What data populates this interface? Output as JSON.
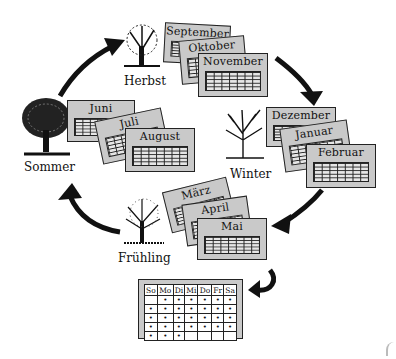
{
  "diagram": {
    "type": "cycle",
    "seasons": [
      {
        "id": "herbst",
        "label": "Herbst",
        "months": [
          "September",
          "Oktober",
          "November"
        ]
      },
      {
        "id": "winter",
        "label": "Winter",
        "months": [
          "Dezember",
          "Januar",
          "Februar"
        ]
      },
      {
        "id": "fruehling",
        "label": "Frühling",
        "months": [
          "März",
          "April",
          "Mai"
        ]
      },
      {
        "id": "sommer",
        "label": "Sommer",
        "months": [
          "Juni",
          "Juli",
          "August"
        ]
      }
    ],
    "cycle_order": [
      "Sommer",
      "Herbst",
      "Winter",
      "Frühling",
      "Sommer"
    ],
    "week_calendar": {
      "days": [
        "So",
        "Mo",
        "Di",
        "Mi",
        "Do",
        "Fr",
        "Sa"
      ],
      "rows": [
        [
          false,
          true,
          true,
          true,
          true,
          true,
          true
        ],
        [
          true,
          true,
          true,
          true,
          true,
          true,
          true
        ],
        [
          true,
          true,
          true,
          true,
          true,
          true,
          true
        ],
        [
          true,
          true,
          true,
          true,
          true,
          true,
          true
        ],
        [
          true,
          true,
          true,
          false,
          false,
          false,
          false
        ]
      ]
    },
    "colors": {
      "card_fill": "#c9c9c9",
      "grid_fill": "#e6e6e6",
      "ink": "#111111",
      "background": "#ffffff"
    }
  }
}
